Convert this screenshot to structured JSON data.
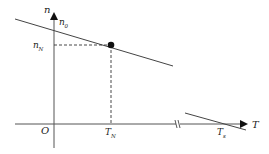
{
  "diagram": {
    "type": "mechanical-characteristic",
    "axes": {
      "y_label": "n",
      "x_label": "T",
      "origin_label": "O"
    },
    "labels": {
      "n0": {
        "main": "n",
        "sub": "0"
      },
      "nN": {
        "main": "n",
        "sub": "N"
      },
      "TN": {
        "main": "T",
        "sub": "N"
      },
      "Ts": {
        "main": "T",
        "sub": "s"
      }
    },
    "rated_point": {
      "x": 111,
      "y": 45
    },
    "axis_break": true,
    "colors": {
      "line": "#333333",
      "dashed": "#333333",
      "point": "#111111"
    }
  }
}
